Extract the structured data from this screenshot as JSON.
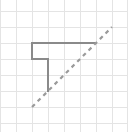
{
  "diagram": {
    "type": "grid-drawing",
    "grid": {
      "columns": 8,
      "rows": 8,
      "line_color": "#e4e4e4"
    },
    "shapes": [
      {
        "name": "step-polyline",
        "style": "solid",
        "color": "#8a8a8a",
        "points_grid_units": [
          [
            6,
            2
          ],
          [
            2,
            2
          ],
          [
            2,
            3
          ],
          [
            3,
            3
          ],
          [
            3,
            5
          ]
        ]
      },
      {
        "name": "diagonal-line",
        "style": "dashed",
        "color": "#9a9a9a",
        "points_grid_units": [
          [
            2,
            6
          ],
          [
            7,
            1
          ]
        ]
      }
    ]
  }
}
